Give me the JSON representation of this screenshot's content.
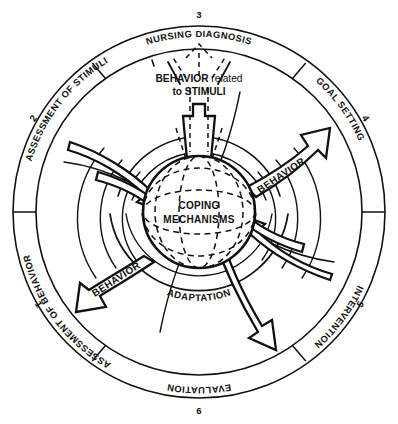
{
  "diagram": {
    "center": {
      "line1": "COPING",
      "line2": "MECHANISMS"
    },
    "stimuli_note": {
      "line1_strong": "BEHAVIOR",
      "line1_soft": " related",
      "line2": "to STIMULI"
    },
    "adaptation_label": "ADAPTATION",
    "arrow_labels": {
      "right": "BEHAVIOR",
      "left": "BEHAVIOR"
    },
    "ring_segments": [
      {
        "number": "1",
        "label": "ASSESSMENT OF BEHAVIOR"
      },
      {
        "number": "2",
        "label": "ASSESSMENT OF STIMULI"
      },
      {
        "number": "3",
        "label": "NURSING DIAGNOSIS"
      },
      {
        "number": "4",
        "label": "GOAL SETTING"
      },
      {
        "number": "5",
        "label": "INTERVENTION"
      },
      {
        "number": "6",
        "label": "EVALUATION"
      }
    ],
    "colors": {
      "ink": "#111111",
      "background": "#ffffff"
    }
  }
}
